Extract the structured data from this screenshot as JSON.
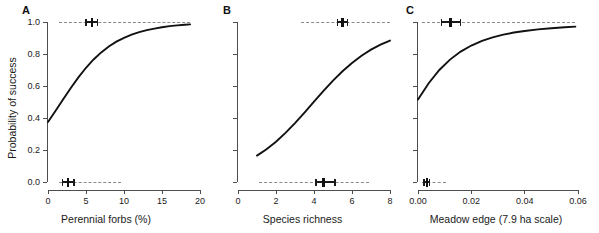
{
  "figure": {
    "ylabel": "Probability of success",
    "panels": [
      {
        "letter": "A",
        "xlabel": "Perennial forbs (%)",
        "xticks": [
          "0",
          "5",
          "10",
          "15",
          "20"
        ],
        "xtick_values": [
          0,
          5,
          10,
          15,
          20
        ],
        "yticks": [
          "1.0",
          "0.8",
          "0.6",
          "0.4",
          "0.2",
          "0.0"
        ],
        "ytick_values": [
          1.0,
          0.8,
          0.6,
          0.4,
          0.2,
          0.0
        ]
      },
      {
        "letter": "B",
        "xlabel": "Species richness",
        "xticks": [
          "0",
          "2",
          "4",
          "6",
          "8"
        ],
        "xtick_values": [
          0,
          2,
          4,
          6,
          8
        ],
        "yticks": [],
        "ytick_values": []
      },
      {
        "letter": "C",
        "xlabel": "Meadow edge (7.9 ha scale)",
        "xticks": [
          "0.00",
          "0.02",
          "0.04",
          "0.06"
        ],
        "xtick_values": [
          0.0,
          0.02,
          0.04,
          0.06
        ],
        "yticks": [],
        "ytick_values": []
      }
    ]
  },
  "chart_data": [
    {
      "type": "line",
      "panel": "A",
      "title": "",
      "xlabel": "Perennial forbs (%)",
      "ylabel": "Probability of success",
      "xlim": [
        0,
        20
      ],
      "ylim": [
        0,
        1
      ],
      "grid": false,
      "legend": "none",
      "series": [
        {
          "name": "Logistic fit",
          "x": [
            0,
            1,
            2,
            3,
            4,
            5,
            6,
            7,
            8,
            9,
            10,
            11,
            12,
            13,
            14,
            15,
            16,
            17,
            18,
            18.7
          ],
          "y": [
            0.375,
            0.445,
            0.517,
            0.588,
            0.654,
            0.714,
            0.766,
            0.81,
            0.847,
            0.877,
            0.901,
            0.921,
            0.937,
            0.949,
            0.959,
            0.967,
            0.974,
            0.979,
            0.983,
            0.985
          ]
        }
      ],
      "reference_lines": [
        {
          "name": "success-level",
          "y": 1.0,
          "style": "dashed",
          "x_from": 1.4,
          "x_to": 18.7
        },
        {
          "name": "failure-level",
          "y": 0.0,
          "style": "dashed",
          "x_from": 1.4,
          "x_to": 9.6
        }
      ],
      "error_bars": [
        {
          "name": "success-group-mean",
          "y": 1.0,
          "mean": 5.75,
          "low": 5.0,
          "high": 6.5
        },
        {
          "name": "failure-group-mean",
          "y": 0.0,
          "mean": 2.6,
          "low": 1.9,
          "high": 3.4
        }
      ]
    },
    {
      "type": "line",
      "panel": "B",
      "title": "",
      "xlabel": "Species richness",
      "ylabel": "Probability of success",
      "xlim": [
        0,
        8
      ],
      "ylim": [
        0,
        1
      ],
      "grid": false,
      "legend": "none",
      "series": [
        {
          "name": "Logistic fit",
          "x": [
            1.0,
            1.5,
            2.0,
            2.5,
            3.0,
            3.5,
            4.0,
            4.5,
            5.0,
            5.5,
            6.0,
            6.5,
            7.0,
            7.5,
            8.0
          ],
          "y": [
            0.165,
            0.205,
            0.252,
            0.307,
            0.368,
            0.434,
            0.503,
            0.57,
            0.634,
            0.692,
            0.744,
            0.789,
            0.827,
            0.858,
            0.884
          ]
        }
      ],
      "reference_lines": [
        {
          "name": "success-level",
          "y": 1.0,
          "style": "dashed",
          "x_from": 3.3,
          "x_to": 8.0
        },
        {
          "name": "failure-level",
          "y": 0.0,
          "style": "dashed",
          "x_from": 1.1,
          "x_to": 6.9
        }
      ],
      "error_bars": [
        {
          "name": "success-group-mean",
          "y": 1.0,
          "mean": 5.5,
          "low": 5.25,
          "high": 5.75
        },
        {
          "name": "failure-group-mean",
          "y": 0.0,
          "mean": 4.5,
          "low": 4.1,
          "high": 5.1
        }
      ]
    },
    {
      "type": "line",
      "panel": "C",
      "title": "",
      "xlabel": "Meadow edge (7.9 ha scale)",
      "ylabel": "Probability of success",
      "xlim": [
        0,
        0.06
      ],
      "ylim": [
        0,
        1
      ],
      "grid": false,
      "legend": "none",
      "series": [
        {
          "name": "Logistic fit",
          "x": [
            0.0,
            0.004,
            0.008,
            0.012,
            0.016,
            0.02,
            0.024,
            0.028,
            0.032,
            0.036,
            0.04,
            0.045,
            0.05,
            0.055,
            0.059
          ],
          "y": [
            0.515,
            0.617,
            0.7,
            0.765,
            0.815,
            0.853,
            0.882,
            0.904,
            0.921,
            0.934,
            0.944,
            0.954,
            0.961,
            0.967,
            0.971
          ]
        }
      ],
      "reference_lines": [
        {
          "name": "success-level",
          "y": 1.0,
          "style": "dashed",
          "x_from": 0.0015,
          "x_to": 0.059
        },
        {
          "name": "failure-level",
          "y": 0.0,
          "style": "dashed",
          "x_from": 0.0015,
          "x_to": 0.0105
        }
      ],
      "error_bars": [
        {
          "name": "success-group-mean",
          "y": 1.0,
          "mean": 0.0122,
          "low": 0.0088,
          "high": 0.016
        },
        {
          "name": "failure-group-mean",
          "y": 0.0,
          "mean": 0.0033,
          "low": 0.0022,
          "high": 0.0043
        }
      ]
    }
  ]
}
